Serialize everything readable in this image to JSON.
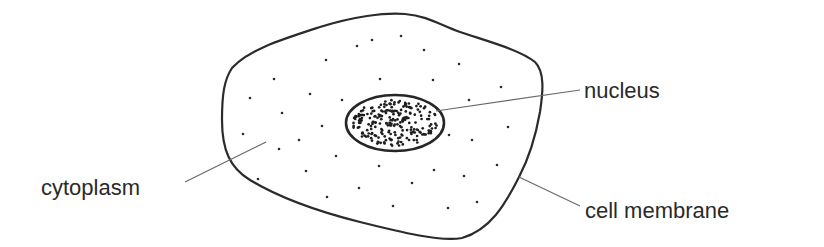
{
  "diagram": {
    "labels": {
      "nucleus": "nucleus",
      "cytoplasm": "cytoplasm",
      "cell_membrane": "cell membrane"
    },
    "parts": [
      {
        "id": "cell-membrane",
        "kind": "outline",
        "description": "irregular polygonal cell boundary"
      },
      {
        "id": "cytoplasm",
        "kind": "region",
        "description": "sparse evenly scattered dots inside the cell"
      },
      {
        "id": "nucleus",
        "kind": "ellipse",
        "description": "oval filled with dense clustered dots (chromatin)"
      }
    ],
    "colors": {
      "ink": "#2b2b2b",
      "leader": "#6a6a6a",
      "background": "#ffffff"
    }
  }
}
